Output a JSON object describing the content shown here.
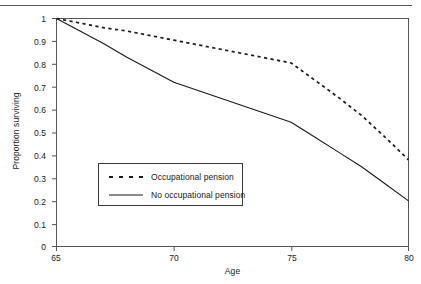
{
  "chart_data": {
    "type": "line",
    "title": "",
    "xlabel": "Age",
    "ylabel": "Proportion surviving",
    "xlim": [
      65,
      80
    ],
    "ylim": [
      0,
      1
    ],
    "xticks": [
      65,
      70,
      75,
      80
    ],
    "xtick_labels": [
      "65",
      "70",
      "75",
      "80"
    ],
    "yticks": [
      0,
      0.1,
      0.2,
      0.3,
      0.4,
      0.5,
      0.6,
      0.7,
      0.8,
      0.9,
      1
    ],
    "ytick_labels": [
      "0",
      "0.1",
      "0.2",
      "0.3",
      "0.4",
      "0.5",
      "0.6",
      "0.7",
      "0.8",
      "0.9",
      "1"
    ],
    "grid": false,
    "legend_position": "center-left",
    "line_color": "#1a1a1a",
    "series": [
      {
        "name": "Occupational pension",
        "style": "dashed",
        "x": [
          65,
          66,
          67,
          68,
          69,
          70,
          71,
          72,
          73,
          74,
          75,
          76,
          77,
          78,
          79,
          80
        ],
        "values": [
          1.0,
          0.98,
          0.96,
          0.945,
          0.925,
          0.905,
          0.885,
          0.865,
          0.845,
          0.825,
          0.805,
          0.73,
          0.655,
          0.575,
          0.48,
          0.38
        ]
      },
      {
        "name": "No occupational pension",
        "style": "solid",
        "x": [
          65,
          66,
          67,
          68,
          69,
          70,
          71,
          72,
          73,
          74,
          75,
          76,
          77,
          78,
          79,
          80
        ],
        "values": [
          1.0,
          0.945,
          0.89,
          0.83,
          0.775,
          0.72,
          0.685,
          0.65,
          0.615,
          0.58,
          0.545,
          0.48,
          0.415,
          0.35,
          0.275,
          0.2
        ]
      }
    ]
  },
  "legend": {
    "items": [
      {
        "label": "Occupational pension",
        "style": "dashed"
      },
      {
        "label": "No occupational pension",
        "style": "solid"
      }
    ]
  },
  "axes": {
    "x_title": "Age",
    "y_title": "Proportion surviving"
  }
}
